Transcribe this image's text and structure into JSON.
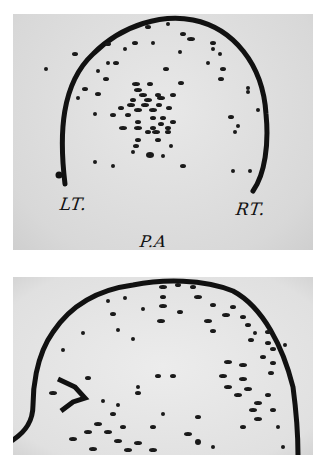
{
  "figure": {
    "top_panel": {
      "description": "Radiographic dot scan (anterior view outline) with left/right markers",
      "labels": {
        "left": "LT.",
        "right": "RT.",
        "view": "P.A"
      }
    },
    "bottom_panel": {
      "description": "Radiographic dot scan (lateral outline) with arrow marker",
      "marker": "arrow-marker"
    }
  },
  "colors": {
    "ink": "#111111",
    "film": "#e0e0e0",
    "background": "#ffffff"
  }
}
